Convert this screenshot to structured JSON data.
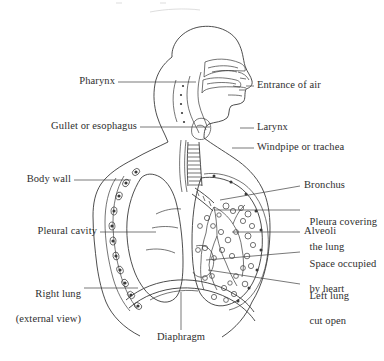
{
  "figure": {
    "background_color": "#ffffff",
    "line_color": "#3a3a3a",
    "text_color": "#2e2e2e",
    "width": 384,
    "height": 361
  },
  "labels": {
    "pharynx": "Pharynx",
    "gullet_or_esophagus": "Gullet or esophagus",
    "body_wall": "Body wall",
    "pleural_cavity": "Pleural cavity",
    "right_lung_line1": "Right lung",
    "right_lung_line2": "(external view)",
    "entrance_of_air": "Entrance of air",
    "larynx": "Larynx",
    "windpipe_or_trachea": "Windpipe or trachea",
    "bronchus": "Bronchus",
    "pleura_line1": "Pleura covering",
    "pleura_line2": "the lung",
    "alveoli": "Alveoli",
    "space_heart_line1": "Space occupied",
    "space_heart_line2": "by heart",
    "left_lung_line1": "Left lung",
    "left_lung_line2": "cut open",
    "diaphragm": "Diaphragm"
  },
  "label_sides": {
    "left": [
      "Pharynx",
      "Gullet or esophagus",
      "Body wall",
      "Pleural cavity",
      "Right lung (external view)"
    ],
    "right": [
      "Entrance of air",
      "Larynx",
      "Windpipe or trachea",
      "Bronchus",
      "Pleura covering the lung",
      "Alveoli",
      "Space occupied by heart",
      "Left lung cut open"
    ],
    "bottom": [
      "Diaphragm"
    ]
  }
}
